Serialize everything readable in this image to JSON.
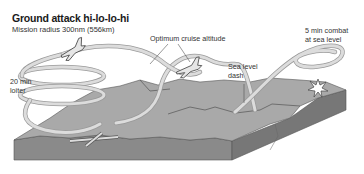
{
  "title": "Ground attack hi-lo-lo-hi",
  "subtitle": "Mission radius 300nm (556km)",
  "labels": {
    "cruise": "Optimum cruise altitude",
    "dash_line1": "Sea level",
    "dash_line2": "dash",
    "combat_line1": "5 min combat",
    "combat_line2": "at sea level",
    "loiter_line1": "20 min",
    "loiter_line2": "loiter"
  },
  "colors": {
    "terrain_top": "#a9a9a9",
    "terrain_side": "#8a8a8a",
    "terrain_side_dark": "#777777",
    "flight_path": "#d6d6d6",
    "flight_path_edge": "#9a9a9a",
    "ridge": "#555555",
    "text": "#1a1a1a"
  }
}
